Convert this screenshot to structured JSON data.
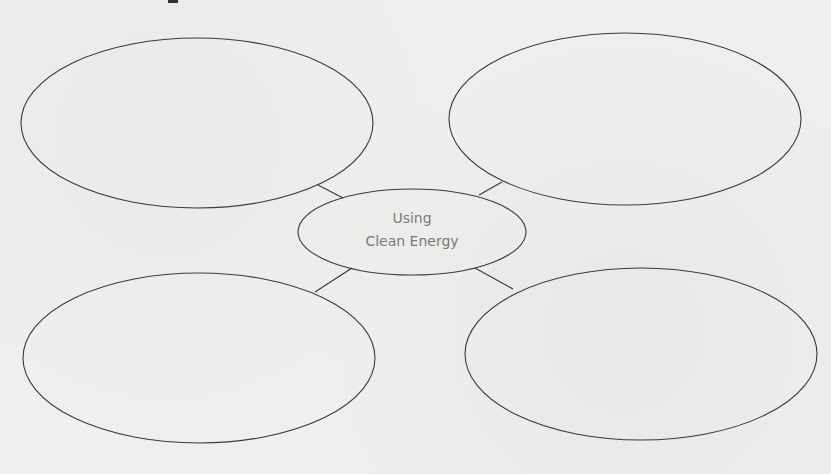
{
  "diagram": {
    "type": "concept-web",
    "center": {
      "line1": "Using",
      "line2": "Clean Energy"
    },
    "branches": [
      {
        "position": "top-left",
        "text": ""
      },
      {
        "position": "top-right",
        "text": ""
      },
      {
        "position": "bottom-left",
        "text": ""
      },
      {
        "position": "bottom-right",
        "text": ""
      }
    ],
    "colors": {
      "background": "#efefed",
      "stroke": "#3a3a3a",
      "center_text": "#7a7a7a"
    }
  }
}
